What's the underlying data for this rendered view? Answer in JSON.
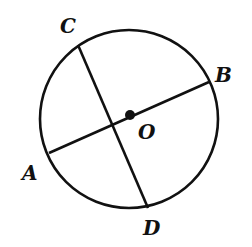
{
  "diagram": {
    "type": "geometry-circle",
    "circle": {
      "center_label": "O",
      "cx": 129,
      "cy": 119,
      "r": 89
    },
    "points": {
      "A": {
        "label": "A",
        "x": 49,
        "y": 153,
        "label_x": 22,
        "label_y": 180
      },
      "B": {
        "label": "B",
        "x": 209,
        "y": 82,
        "label_x": 215,
        "label_y": 82
      },
      "C": {
        "label": "C",
        "x": 78,
        "y": 45,
        "label_x": 60,
        "label_y": 33
      },
      "D": {
        "label": "D",
        "x": 148,
        "y": 208,
        "label_x": 143,
        "label_y": 235
      },
      "O": {
        "label": "O",
        "x": 130,
        "y": 115,
        "label_x": 138,
        "label_y": 139
      }
    },
    "segments": [
      {
        "from": "A",
        "to": "B",
        "note": "diameter through O"
      },
      {
        "from": "C",
        "to": "D",
        "note": "chord"
      }
    ],
    "stroke_color": "#111111"
  }
}
